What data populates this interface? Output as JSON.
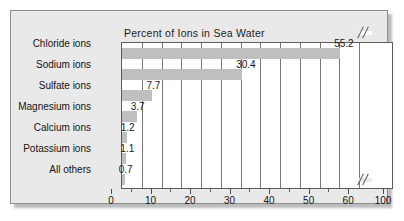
{
  "chart_data": {
    "type": "bar",
    "orientation": "horizontal",
    "title": "Percent of Ions in Sea Water",
    "xlabel": "",
    "ylabel": "",
    "categories": [
      "Chloride ions",
      "Sodium ions",
      "Sulfate ions",
      "Magnesium ions",
      "Calcium ions",
      "Potassium ions",
      "All others"
    ],
    "values": [
      55.2,
      30.4,
      7.7,
      3.7,
      1.2,
      1.1,
      0.7
    ],
    "value_labels": [
      "55.2",
      "30.4",
      "7.7",
      "3.7",
      "1.2",
      "1.1",
      "0.7"
    ],
    "xlim": [
      0,
      100
    ],
    "xticks": [
      0,
      10,
      20,
      30,
      40,
      50,
      60,
      100
    ],
    "xtick_labels": [
      "0",
      "10",
      "20",
      "30",
      "40",
      "50",
      "60",
      "100"
    ],
    "minor_xticks": [
      5,
      15,
      25,
      35,
      45,
      55
    ],
    "grid": true,
    "grid_axis": "x",
    "legend": false,
    "axis_break": {
      "present": true,
      "between": [
        60,
        100
      ],
      "style": "double-slash"
    },
    "colors": {
      "bar_fill": "#bfbfbf",
      "plot_background": "#ffffff",
      "figure_background": "#e9e9e9",
      "axis": "#5c5c5c",
      "gridline": "#777777",
      "text": "#141414"
    }
  }
}
